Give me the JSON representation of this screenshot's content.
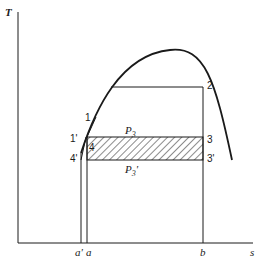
{
  "diagram": {
    "type": "T-s diagram",
    "axes": {
      "y_label": "T",
      "x_label": "s"
    },
    "x_ticks": [
      {
        "label": "a'",
        "x": 81
      },
      {
        "label": "a",
        "x": 87
      },
      {
        "label": "b",
        "x": 203
      }
    ],
    "points": {
      "p1": "1",
      "p1p": "1'",
      "p2": "2",
      "p3": "3",
      "p3p": "3'",
      "p4": "4",
      "p4p": "4'"
    },
    "pressures": {
      "upper": "P3",
      "lower": "P3'"
    },
    "colors": {
      "line": "#1a1a1a",
      "background": "#ffffff"
    }
  }
}
